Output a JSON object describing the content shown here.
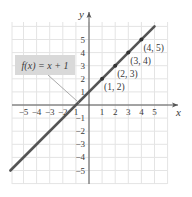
{
  "chart_data": {
    "type": "line",
    "title": "",
    "xlabel": "x",
    "ylabel": "y",
    "xlim": [
      -6,
      6
    ],
    "ylim": [
      -6,
      6
    ],
    "grid": true,
    "x_ticks": [
      -5,
      -4,
      -3,
      -2,
      -1,
      1,
      2,
      3,
      4,
      5
    ],
    "y_ticks": [
      -5,
      -4,
      -3,
      -2,
      -1,
      1,
      2,
      3,
      4,
      5
    ],
    "x_tick_labels": [
      "−5",
      "−4",
      "−3",
      "−2",
      "1",
      "1",
      "2",
      "3",
      "4",
      "5"
    ],
    "y_tick_labels": [
      "−5",
      "−4",
      "−3",
      "−2",
      "−1",
      "1",
      "2",
      "3",
      "4",
      "5"
    ],
    "series": [
      {
        "name": "f(x) = x + 1",
        "color": "#555555",
        "x": [
          -6,
          5
        ],
        "y": [
          -5,
          6
        ]
      }
    ],
    "points": [
      {
        "x": 1,
        "y": 2,
        "label": "(1, 2)"
      },
      {
        "x": 2,
        "y": 3,
        "label": "(2, 3)"
      },
      {
        "x": 3,
        "y": 4,
        "label": "(3, 4)"
      },
      {
        "x": 4,
        "y": 5,
        "label": "(4, 5)"
      }
    ],
    "annotation": {
      "text": "f(x) = x + 1",
      "background": "#d9d9d9",
      "points_to": {
        "x": -0.8,
        "y": 0.2
      }
    }
  },
  "axes": {
    "x_label": "x",
    "y_label": "y"
  },
  "label_box": {
    "text": "f(x) = x + 1"
  },
  "colors": {
    "grid": "#e4e4e4",
    "axis": "#555555",
    "line": "#555555",
    "label_bg": "#d9d9d9"
  }
}
